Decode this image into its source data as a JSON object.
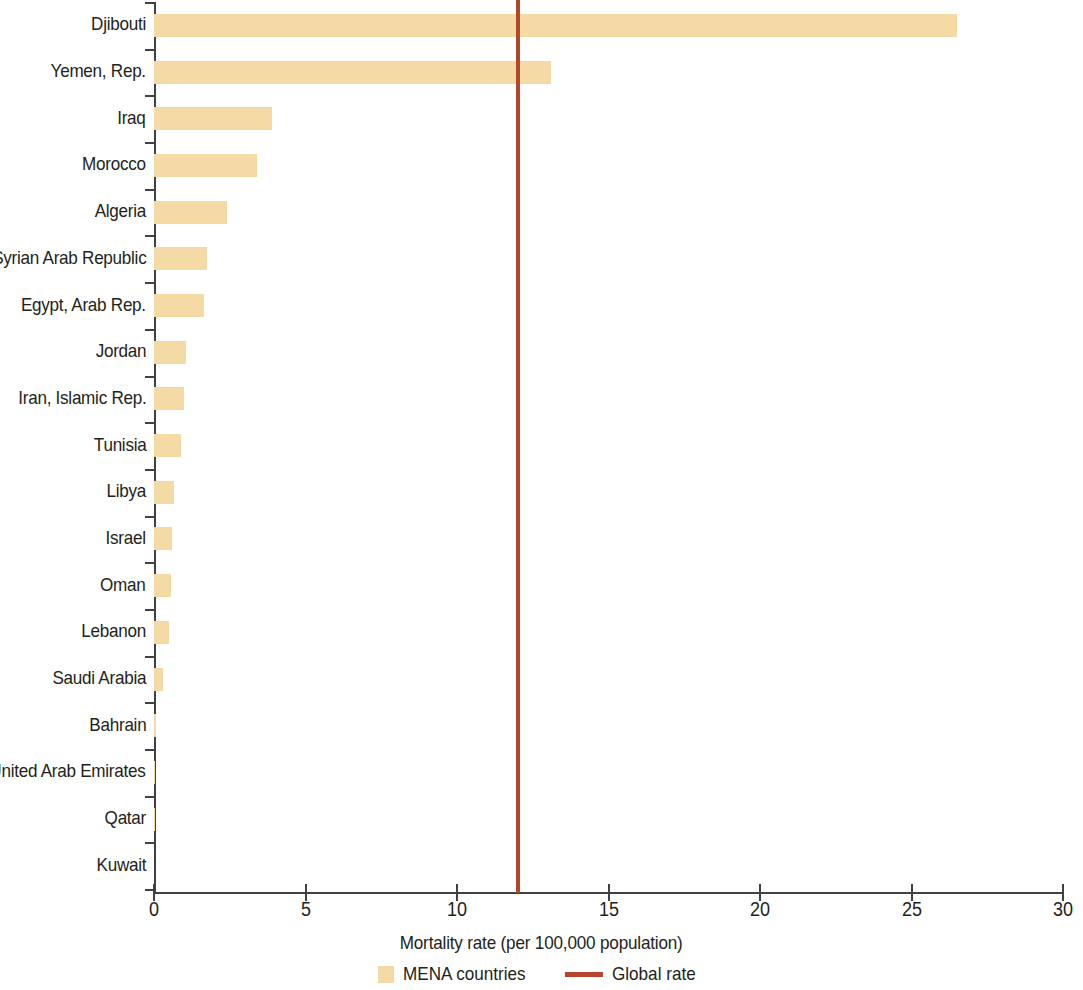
{
  "chart_data": {
    "type": "bar",
    "orientation": "horizontal",
    "title": "",
    "subtitle": "",
    "xlabel": "Mortality rate (per 100,000 population)",
    "ylabel": "",
    "xlim": [
      0,
      30
    ],
    "xticks": [
      0,
      5,
      10,
      15,
      20,
      25,
      30
    ],
    "xtick_labels": [
      "0",
      "5",
      "10",
      "15",
      "20",
      "25",
      "30"
    ],
    "grid": false,
    "legend_position": "bottom-center",
    "categories": [
      "Djibouti",
      "Yemen, Rep.",
      "Iraq",
      "Morocco",
      "Algeria",
      "Syrian Arab Republic",
      "Egypt, Arab Rep.",
      "Jordan",
      "Iran, Islamic Rep.",
      "Tunisia",
      "Libya",
      "Israel",
      "Oman",
      "Lebanon",
      "Saudi Arabia",
      "Bahrain",
      "United Arab Emirates",
      "Qatar",
      "Kuwait"
    ],
    "series": [
      {
        "name": "MENA countries",
        "color": "#f4dba5",
        "values": [
          26.5,
          13.1,
          3.9,
          3.4,
          2.4,
          1.75,
          1.65,
          1.05,
          1.0,
          0.9,
          0.65,
          0.6,
          0.55,
          0.5,
          0.3,
          0.05,
          0.03,
          0.02,
          0.01
        ]
      }
    ],
    "reference_lines": [
      {
        "name": "Global rate",
        "value": 12,
        "color": "#b4472b",
        "orientation": "vertical"
      }
    ],
    "legend": [
      {
        "label": "MENA countries",
        "marker": "box",
        "color": "#f4dba5"
      },
      {
        "label": "Global rate",
        "marker": "line",
        "color": "#b4472b"
      }
    ]
  },
  "axis": {
    "x_title": "Mortality rate (per 100,000 population)"
  },
  "colors": {
    "bar": "#f4dba5",
    "reference_line": "#b4472b",
    "axis": "#414042",
    "text": "#231f20",
    "background": "#ffffff"
  }
}
